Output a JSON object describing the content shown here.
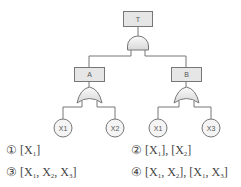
{
  "diagram": {
    "type": "fault-tree",
    "top_event": {
      "label": "T",
      "gate": "AND"
    },
    "intermediate_events": [
      {
        "label": "A",
        "gate": "OR",
        "inputs": [
          "X1",
          "X2"
        ]
      },
      {
        "label": "B",
        "gate": "OR",
        "inputs": [
          "X1",
          "X3"
        ]
      }
    ],
    "basic_events": [
      "X1",
      "X2",
      "X1",
      "X3"
    ],
    "colors": {
      "box_fill": "#e6e6e6",
      "stroke": "#777777",
      "gate_fill": "#eeeeee"
    }
  },
  "options": [
    {
      "number": "①",
      "parts": [
        [
          "[X",
          "1",
          "]"
        ]
      ]
    },
    {
      "number": "②",
      "parts": [
        [
          "[X",
          "1",
          "]"
        ],
        [
          ", [X",
          "2",
          "]"
        ]
      ]
    },
    {
      "number": "③",
      "parts": [
        [
          "[X",
          "1",
          ""
        ],
        [
          ", X",
          "2",
          ""
        ],
        [
          ", X",
          "3",
          "]"
        ]
      ]
    },
    {
      "number": "④",
      "parts": [
        [
          "[X",
          "1",
          ""
        ],
        [
          ", X",
          "2",
          "]"
        ],
        [
          ", [X",
          "1",
          ""
        ],
        [
          ", X",
          "3",
          "]"
        ]
      ]
    }
  ]
}
